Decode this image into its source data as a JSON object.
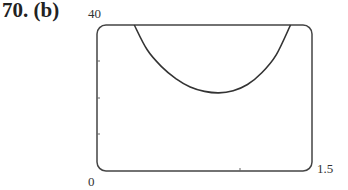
{
  "problem": {
    "number": "70.",
    "part": "(b)",
    "label": "70. (b)"
  },
  "axes": {
    "y_max_label": "40",
    "origin_label": "0",
    "x_max_label": "1.5"
  },
  "chart_data": {
    "type": "line",
    "title": "70. (b)",
    "xlabel": "",
    "ylabel": "",
    "xlim": [
      0,
      1.5
    ],
    "ylim": [
      0,
      40
    ],
    "x_tick_labels": [
      "0",
      "1.5"
    ],
    "y_tick_labels": [
      "0",
      "40"
    ],
    "y_minor_ticks": [
      10,
      20,
      30
    ],
    "x_minor_ticks": [
      1.0
    ],
    "grid": false,
    "series": [
      {
        "name": "curve",
        "x": [
          0.26,
          0.35,
          0.45,
          0.55,
          0.65,
          0.75,
          0.85,
          0.95,
          1.05,
          1.15,
          1.25,
          1.35
        ],
        "y": [
          40,
          33.2,
          28.6,
          25.3,
          23.0,
          21.8,
          21.4,
          22.0,
          23.7,
          26.9,
          31.8,
          40
        ]
      }
    ]
  }
}
